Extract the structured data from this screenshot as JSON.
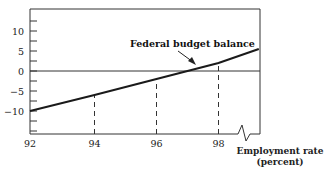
{
  "chart_data": {
    "type": "line",
    "title": "",
    "xlabel": "Employment rate (percent)",
    "xlabel_lines": [
      "Employment rate",
      "(percent)"
    ],
    "ylabel": "",
    "xlim": [
      92,
      99.3
    ],
    "ylim": [
      -15.7,
      15.5
    ],
    "x_ticks": [
      92,
      94,
      96,
      98
    ],
    "x_tick_labels": [
      "92",
      "94",
      "96",
      "98"
    ],
    "y_ticks": [
      -15,
      -12.5,
      -10,
      -7.5,
      -5,
      -2.5,
      0,
      2.5,
      5,
      7.5,
      10,
      12.5
    ],
    "y_tick_labels": [
      {
        "value": 10,
        "label": "10"
      },
      {
        "value": 5,
        "label": "5"
      },
      {
        "value": 0,
        "label": "0"
      },
      {
        "value": -5,
        "label": "−5"
      },
      {
        "value": -10,
        "label": "−10"
      }
    ],
    "grid": false,
    "reference_line": {
      "y": 0
    },
    "axis_break": {
      "x_position": "between 98 and right edge",
      "style": "zigzag"
    },
    "series": [
      {
        "name": "Federal budget balance",
        "x": [
          92,
          94,
          96,
          98,
          99.3
        ],
        "values": [
          -10,
          -6,
          -2,
          2,
          5.5
        ]
      }
    ],
    "dashed_guides": [
      {
        "x": 94,
        "y_at_line": -6
      },
      {
        "x": 96,
        "y_at_line": -2
      },
      {
        "x": 98,
        "y_at_line": 2
      }
    ],
    "annotations": [
      {
        "text": "Federal budget balance",
        "points_to": {
          "x": 96.9,
          "y": 0.5
        }
      }
    ]
  }
}
